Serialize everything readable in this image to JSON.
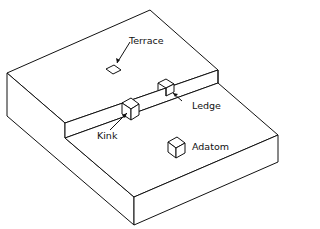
{
  "diagram": {
    "labels": {
      "terrace": "Terrace",
      "ledge": "Ledge",
      "kink": "Kink",
      "adatom": "Adatom"
    }
  }
}
